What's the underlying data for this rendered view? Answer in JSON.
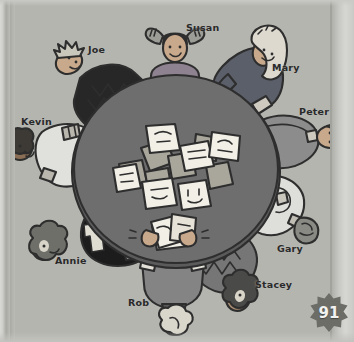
{
  "page": {
    "number": "91",
    "background_color": "#b5b5b0",
    "table_color": "#6e6e6e",
    "table_rim_color": "#5b5b5b"
  },
  "scene": {
    "title": "People seated around a round table playing a card game",
    "table": {
      "cx": 176,
      "cy": 170,
      "rx": 104,
      "ry": 96
    },
    "cards_on_table": 14,
    "card_colors": {
      "face_up": "#f2efe6",
      "face_down": "#a9a69c",
      "outline": "#2f2f2f"
    }
  },
  "people": [
    {
      "id": "susan",
      "label": "Susan",
      "label_x": 186,
      "label_y": 26,
      "position": "top",
      "angle": 0,
      "hair_color": "#8d8d8d",
      "hair_style": "pigtails",
      "skin_color": "#c4a186",
      "shirt_color": "#8e8190",
      "sleeve_color": "#8e8190"
    },
    {
      "id": "mary",
      "label": "Mary",
      "label_x": 272,
      "label_y": 68,
      "position": "top-right",
      "angle": 50,
      "hair_color": "#d8d6cd",
      "hair_style": "long-straight",
      "skin_color": "#c9a98c",
      "shirt_color": "#5b5f69",
      "sleeve_color": "#5b5f69"
    },
    {
      "id": "peter",
      "label": "Peter",
      "label_x": 300,
      "label_y": 113,
      "position": "right",
      "angle": 90,
      "hair_color": "#9a9a95",
      "hair_style": "short",
      "skin_color": "#c9a98c",
      "shirt_color": "#8c8c8c",
      "sleeve_color": "#8c8c8c"
    },
    {
      "id": "gary",
      "label": "Gary",
      "label_x": 278,
      "label_y": 250,
      "position": "bottom-right",
      "angle": 132,
      "hair_color": "#8a8a85",
      "hair_style": "short",
      "skin_color": "#c9a98c",
      "shirt_color": "#dededa",
      "sleeve_color": "#dededa"
    },
    {
      "id": "stacey",
      "label": "Stacey",
      "label_x": 256,
      "label_y": 286,
      "position": "bottom",
      "angle": 160,
      "hair_color": "#4a4a48",
      "hair_style": "curly",
      "skin_color": "#a88c72",
      "shirt_color": "#767676",
      "sleeve_color": "#767676"
    },
    {
      "id": "rob",
      "label": "Rob",
      "label_x": 130,
      "label_y": 304,
      "position": "bottom",
      "angle": 185,
      "hair_color": "#d6d3c8",
      "hair_style": "short",
      "skin_color": "#c9a98c",
      "shirt_color": "#848484",
      "sleeve_color": "#9a9a9a"
    },
    {
      "id": "annie",
      "label": "Annie",
      "label_x": 56,
      "label_y": 262,
      "position": "bottom-left",
      "angle": 225,
      "hair_color": "#6f6f6a",
      "hair_style": "curly",
      "skin_color": "#9a8068",
      "shirt_color": "#1c1c1c",
      "sleeve_color": "#1c1c1c"
    },
    {
      "id": "kevin",
      "label": "Kevin",
      "label_x": 22,
      "label_y": 122,
      "position": "left",
      "angle": 270,
      "hair_color": "#3d3a36",
      "hair_style": "short",
      "skin_color": "#8a6e55",
      "shirt_color": "#e0e0dc",
      "sleeve_color": "#e0e0dc"
    },
    {
      "id": "joe",
      "label": "Joe",
      "label_x": 88,
      "label_y": 50,
      "position": "top-left",
      "angle": 315,
      "hair_color": "#2c2c2c",
      "hair_style": "spiky",
      "skin_color": "#c9a98c",
      "shirt_color": "#272727",
      "sleeve_color": "#272727"
    }
  ]
}
